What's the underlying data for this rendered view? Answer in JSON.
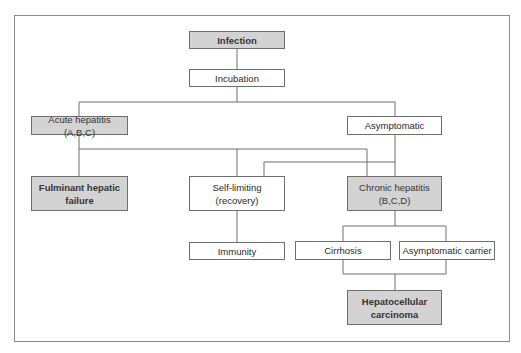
{
  "diagram": {
    "type": "flowchart",
    "nodes": {
      "infection": "Infection",
      "incubation": "Incubation",
      "acute_hepatitis": "Acute hepatitis (A,B,C)",
      "asymptomatic": "Asymptomatic",
      "fulminant": "Fulminant hepatic\nfailure",
      "self_limiting": "Self-limiting\n(recovery)",
      "chronic_hepatitis": "Chronic hepatitis\n(B,C,D)",
      "immunity": "Immunity",
      "cirrhosis": "Cirrhosis",
      "asymptomatic_carrier": "Asymptomatic carrier",
      "hcc": "Hepatocellular\ncarcinoma"
    },
    "edges": [
      [
        "Infection",
        "Incubation"
      ],
      [
        "Incubation",
        "Acute hepatitis (A,B,C)"
      ],
      [
        "Incubation",
        "Asymptomatic"
      ],
      [
        "Acute hepatitis (A,B,C)",
        "Fulminant hepatic failure"
      ],
      [
        "Acute hepatitis (A,B,C)",
        "Self-limiting (recovery)"
      ],
      [
        "Acute hepatitis (A,B,C)",
        "Chronic hepatitis (B,C,D)"
      ],
      [
        "Asymptomatic",
        "Self-limiting (recovery)"
      ],
      [
        "Asymptomatic",
        "Chronic hepatitis (B,C,D)"
      ],
      [
        "Self-limiting (recovery)",
        "Immunity"
      ],
      [
        "Chronic hepatitis (B,C,D)",
        "Cirrhosis"
      ],
      [
        "Chronic hepatitis (B,C,D)",
        "Asymptomatic carrier"
      ],
      [
        "Cirrhosis",
        "Hepatocellular carcinoma"
      ],
      [
        "Asymptomatic carrier",
        "Hepatocellular carcinoma"
      ]
    ],
    "colors": {
      "highlight_fill": "#d3d3d3",
      "plain_fill": "#ffffff",
      "line": "#6e6e6e"
    }
  }
}
